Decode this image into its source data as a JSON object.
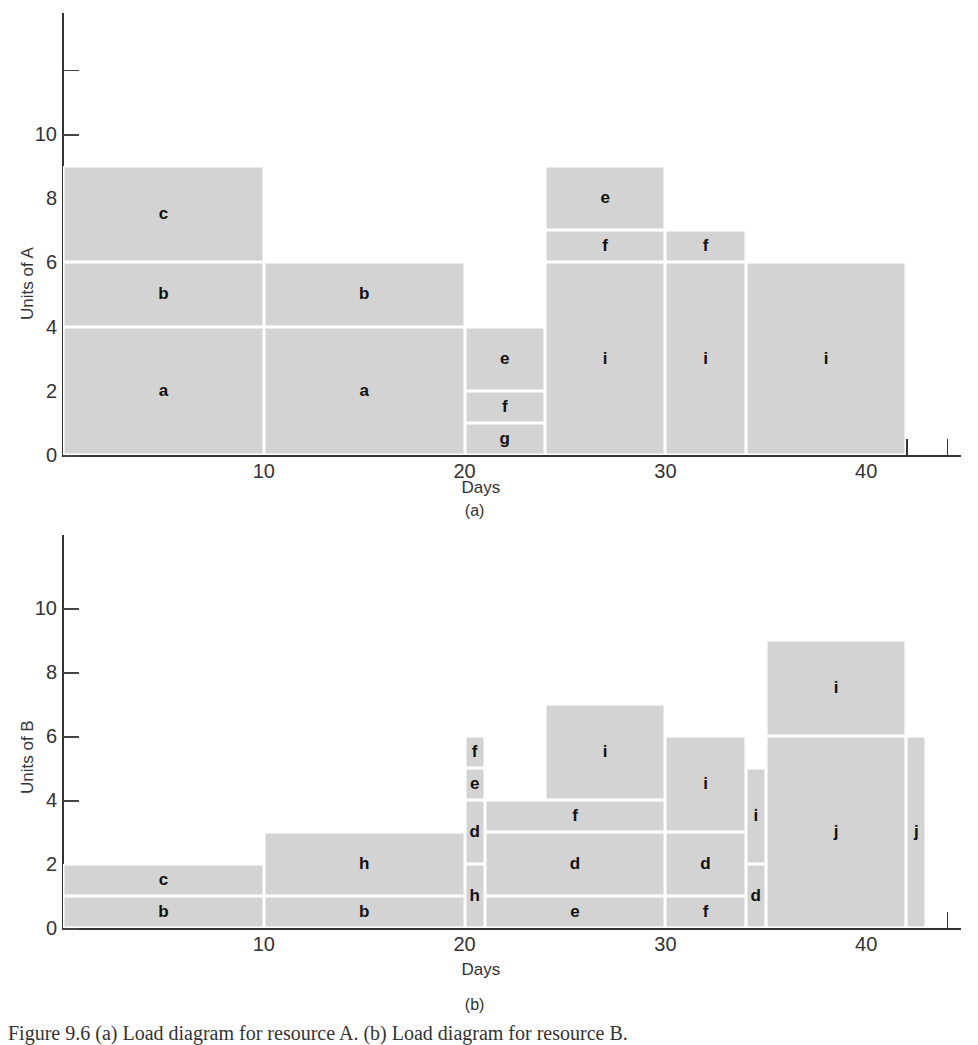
{
  "chart_data": [
    {
      "type": "bar",
      "subtype": "stacked-block load diagram",
      "panel_label": "(a)",
      "title": "",
      "xlabel": "Days",
      "ylabel": "Units of A",
      "xlim": [
        0,
        45
      ],
      "ylim": [
        0,
        13
      ],
      "x_ticks_labeled": [
        10,
        20,
        30,
        40
      ],
      "x_minor_tick_step": 2,
      "y_ticks": [
        0,
        2,
        4,
        6,
        8,
        10,
        12
      ],
      "y_tick_labels": [
        "0",
        "2",
        "4",
        "6",
        "8",
        "10",
        ""
      ],
      "grid": false,
      "blocks": [
        {
          "label": "a",
          "x0": 0,
          "x1": 10,
          "y0": 0,
          "y1": 4
        },
        {
          "label": "b",
          "x0": 0,
          "x1": 10,
          "y0": 4,
          "y1": 6
        },
        {
          "label": "c",
          "x0": 0,
          "x1": 10,
          "y0": 6,
          "y1": 9
        },
        {
          "label": "a",
          "x0": 10,
          "x1": 20,
          "y0": 0,
          "y1": 4
        },
        {
          "label": "b",
          "x0": 10,
          "x1": 20,
          "y0": 4,
          "y1": 6
        },
        {
          "label": "g",
          "x0": 20,
          "x1": 24,
          "y0": 0,
          "y1": 1
        },
        {
          "label": "f",
          "x0": 20,
          "x1": 24,
          "y0": 1,
          "y1": 2
        },
        {
          "label": "e",
          "x0": 20,
          "x1": 24,
          "y0": 2,
          "y1": 4
        },
        {
          "label": "i",
          "x0": 24,
          "x1": 30,
          "y0": 0,
          "y1": 6
        },
        {
          "label": "f",
          "x0": 24,
          "x1": 30,
          "y0": 6,
          "y1": 7
        },
        {
          "label": "e",
          "x0": 24,
          "x1": 30,
          "y0": 7,
          "y1": 9
        },
        {
          "label": "i",
          "x0": 30,
          "x1": 34,
          "y0": 0,
          "y1": 6
        },
        {
          "label": "f",
          "x0": 30,
          "x1": 34,
          "y0": 6,
          "y1": 7
        },
        {
          "label": "i",
          "x0": 34,
          "x1": 42,
          "y0": 0,
          "y1": 6
        }
      ],
      "total_load_by_interval": [
        {
          "x0": 0,
          "x1": 10,
          "total": 9
        },
        {
          "x0": 10,
          "x1": 20,
          "total": 6
        },
        {
          "x0": 20,
          "x1": 24,
          "total": 4
        },
        {
          "x0": 24,
          "x1": 30,
          "total": 9
        },
        {
          "x0": 30,
          "x1": 34,
          "total": 7
        },
        {
          "x0": 34,
          "x1": 42,
          "total": 6
        }
      ]
    },
    {
      "type": "bar",
      "subtype": "stacked-block load diagram",
      "panel_label": "(b)",
      "title": "",
      "xlabel": "Days",
      "ylabel": "Units of B",
      "xlim": [
        0,
        45
      ],
      "ylim": [
        0,
        12
      ],
      "x_ticks_labeled": [
        10,
        20,
        30,
        40
      ],
      "x_minor_tick_step": 2,
      "y_ticks": [
        0,
        2,
        4,
        6,
        8,
        10
      ],
      "y_tick_labels": [
        "0",
        "2",
        "4",
        "6",
        "8",
        "10"
      ],
      "grid": false,
      "blocks": [
        {
          "label": "b",
          "x0": 0,
          "x1": 10,
          "y0": 0,
          "y1": 1
        },
        {
          "label": "c",
          "x0": 0,
          "x1": 10,
          "y0": 1,
          "y1": 2
        },
        {
          "label": "b",
          "x0": 10,
          "x1": 20,
          "y0": 0,
          "y1": 1
        },
        {
          "label": "h",
          "x0": 10,
          "x1": 20,
          "y0": 1,
          "y1": 3
        },
        {
          "label": "h",
          "x0": 20,
          "x1": 21,
          "y0": 0,
          "y1": 2
        },
        {
          "label": "d",
          "x0": 20,
          "x1": 21,
          "y0": 2,
          "y1": 4
        },
        {
          "label": "e",
          "x0": 20,
          "x1": 21,
          "y0": 4,
          "y1": 5
        },
        {
          "label": "f",
          "x0": 20,
          "x1": 21,
          "y0": 5,
          "y1": 6
        },
        {
          "label": "e",
          "x0": 21,
          "x1": 30,
          "y0": 0,
          "y1": 1
        },
        {
          "label": "d",
          "x0": 21,
          "x1": 30,
          "y0": 1,
          "y1": 3
        },
        {
          "label": "f",
          "x0": 21,
          "x1": 30,
          "y0": 3,
          "y1": 4
        },
        {
          "label": "i",
          "x0": 24,
          "x1": 30,
          "y0": 4,
          "y1": 7
        },
        {
          "label": "f",
          "x0": 30,
          "x1": 34,
          "y0": 0,
          "y1": 1
        },
        {
          "label": "d",
          "x0": 30,
          "x1": 34,
          "y0": 1,
          "y1": 3
        },
        {
          "label": "i",
          "x0": 30,
          "x1": 34,
          "y0": 3,
          "y1": 6
        },
        {
          "label": "d",
          "x0": 34,
          "x1": 35,
          "y0": 0,
          "y1": 2
        },
        {
          "label": "i",
          "x0": 34,
          "x1": 35,
          "y0": 2,
          "y1": 5
        },
        {
          "label": "j",
          "x0": 35,
          "x1": 42,
          "y0": 0,
          "y1": 6
        },
        {
          "label": "i",
          "x0": 35,
          "x1": 42,
          "y0": 6,
          "y1": 9
        },
        {
          "label": "j",
          "x0": 42,
          "x1": 43,
          "y0": 0,
          "y1": 6
        }
      ],
      "total_load_by_interval": [
        {
          "x0": 0,
          "x1": 10,
          "total": 2
        },
        {
          "x0": 10,
          "x1": 20,
          "total": 3
        },
        {
          "x0": 20,
          "x1": 21,
          "total": 6
        },
        {
          "x0": 21,
          "x1": 24,
          "total": 4
        },
        {
          "x0": 24,
          "x1": 30,
          "total": 7
        },
        {
          "x0": 30,
          "x1": 34,
          "total": 6
        },
        {
          "x0": 34,
          "x1": 35,
          "total": 5
        },
        {
          "x0": 35,
          "x1": 42,
          "total": 9
        },
        {
          "x0": 42,
          "x1": 43,
          "total": 6
        }
      ]
    }
  ],
  "colors": {
    "block_fill": "#d3d3d3",
    "block_divider": "#ffffff",
    "axis": "#333333",
    "label_text": "#111111"
  },
  "figure_caption": "Figure 9.6   (a) Load diagram for resource A. (b) Load diagram for resource B."
}
